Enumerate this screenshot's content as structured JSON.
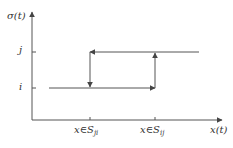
{
  "diagram": {
    "type": "hysteresis-switching",
    "y_axis_label": "σ(t)",
    "x_axis_label": "x(t)",
    "y_levels": [
      {
        "label": "j",
        "y": 52
      },
      {
        "label": "i",
        "y": 88
      }
    ],
    "x_ticks": [
      {
        "prefix": "x∈S",
        "sub": "ji",
        "x": 90
      },
      {
        "prefix": "x∈S",
        "sub": "ij",
        "x": 155
      }
    ],
    "line_color": "#555555"
  }
}
